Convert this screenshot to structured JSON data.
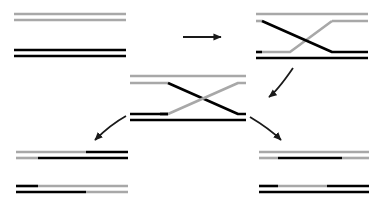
{
  "figure": {
    "title": "DNA strand exchange / Holliday junction recombination",
    "width": 377,
    "height": 211,
    "background": "#ffffff",
    "colors": {
      "black_strand": "#000000",
      "gray_strand": "#a8a8a8",
      "arrow": "#1a1a1a"
    },
    "strand_thickness": 2.6,
    "arrow_thickness": 1.8
  },
  "panels": [
    {
      "id": "panel-parental-duplexes",
      "name": "parental-duplexes",
      "label": "",
      "position": {
        "x": 14,
        "y": 12,
        "width": 112,
        "height": 46
      },
      "duplexes": [
        {
          "id": "duplex-gray-parent",
          "name": "gray-parent-duplex",
          "y": 16,
          "strands": [
            {
              "name": "top-strand",
              "segments": [
                {
                  "from": 0.0,
                  "to": 1.0,
                  "color": "#a8a8a8"
                }
              ]
            },
            {
              "name": "bottom-strand",
              "segments": [
                {
                  "from": 0.0,
                  "to": 1.0,
                  "color": "#a8a8a8"
                }
              ]
            }
          ]
        },
        {
          "id": "duplex-black-parent",
          "name": "black-parent-duplex",
          "y": 50,
          "strands": [
            {
              "name": "top-strand",
              "segments": [
                {
                  "from": 0.0,
                  "to": 1.0,
                  "color": "#000000"
                }
              ]
            },
            {
              "name": "bottom-strand",
              "segments": [
                {
                  "from": 0.0,
                  "to": 1.0,
                  "color": "#000000"
                }
              ]
            }
          ]
        }
      ]
    },
    {
      "id": "panel-crossover-upper-right",
      "name": "upper-right-crossover",
      "label": "",
      "position": {
        "x": 256,
        "y": 10,
        "width": 112,
        "height": 48
      },
      "description": "Strand invasion: gray duplex on top, black duplex below, single strands cross between them forming an X"
    },
    {
      "id": "panel-holliday-junction",
      "name": "holliday-junction-intermediate",
      "label": "",
      "position": {
        "x": 130,
        "y": 72,
        "width": 116,
        "height": 50
      },
      "description": "Holliday junction intermediate with heteroduplex regions; top strands gray-to-black, bottom strands black-to-gray"
    },
    {
      "id": "panel-products-lower-left",
      "name": "lower-left-products",
      "label": "",
      "position": {
        "x": 16,
        "y": 148,
        "width": 112,
        "height": 48
      },
      "duplexes": [
        {
          "id": "duplex-ll-upper",
          "name": "patched-duplex-upper-left",
          "y": 152,
          "strands": [
            {
              "name": "top-strand",
              "segments": [
                {
                  "from": 0.0,
                  "to": 0.63,
                  "color": "#a8a8a8"
                },
                {
                  "from": 0.63,
                  "to": 1.0,
                  "color": "#000000"
                }
              ]
            },
            {
              "name": "bottom-strand",
              "segments": [
                {
                  "from": 0.0,
                  "to": 0.2,
                  "color": "#a8a8a8"
                },
                {
                  "from": 0.2,
                  "to": 1.0,
                  "color": "#000000"
                }
              ]
            }
          ]
        },
        {
          "id": "duplex-ll-lower",
          "name": "patched-duplex-lower-left",
          "y": 186,
          "strands": [
            {
              "name": "top-strand",
              "segments": [
                {
                  "from": 0.0,
                  "to": 0.2,
                  "color": "#000000"
                },
                {
                  "from": 0.2,
                  "to": 1.0,
                  "color": "#a8a8a8"
                }
              ]
            },
            {
              "name": "bottom-strand",
              "segments": [
                {
                  "from": 0.0,
                  "to": 0.63,
                  "color": "#000000"
                },
                {
                  "from": 0.63,
                  "to": 1.0,
                  "color": "#a8a8a8"
                }
              ]
            }
          ]
        }
      ]
    },
    {
      "id": "panel-products-lower-right",
      "name": "lower-right-products",
      "label": "",
      "position": {
        "x": 259,
        "y": 148,
        "width": 110,
        "height": 48
      },
      "duplexes": [
        {
          "id": "duplex-lr-upper",
          "name": "spliced-duplex-upper-right",
          "y": 152,
          "strands": [
            {
              "name": "top-strand",
              "segments": [
                {
                  "from": 0.0,
                  "to": 1.0,
                  "color": "#a8a8a8"
                }
              ]
            },
            {
              "name": "bottom-strand",
              "segments": [
                {
                  "from": 0.0,
                  "to": 0.17,
                  "color": "#a8a8a8"
                },
                {
                  "from": 0.17,
                  "to": 0.75,
                  "color": "#000000"
                },
                {
                  "from": 0.75,
                  "to": 1.0,
                  "color": "#a8a8a8"
                }
              ]
            }
          ]
        },
        {
          "id": "duplex-lr-lower",
          "name": "spliced-duplex-lower-right",
          "y": 186,
          "strands": [
            {
              "name": "top-strand",
              "segments": [
                {
                  "from": 0.0,
                  "to": 0.17,
                  "color": "#000000"
                },
                {
                  "from": 0.17,
                  "to": 0.62,
                  "color": "#a8a8a8"
                },
                {
                  "from": 0.62,
                  "to": 1.0,
                  "color": "#000000"
                }
              ]
            },
            {
              "name": "bottom-strand",
              "segments": [
                {
                  "from": 0.0,
                  "to": 1.0,
                  "color": "#000000"
                }
              ]
            }
          ]
        }
      ]
    }
  ],
  "arrows": [
    {
      "id": "arrow-top",
      "name": "straight-arrow-right",
      "type": "straight",
      "from": {
        "x": 183,
        "y": 37
      },
      "to": {
        "x": 222,
        "y": 37
      },
      "label": ""
    },
    {
      "id": "arrow-right-down",
      "name": "curved-arrow-down-right",
      "type": "curved",
      "from": {
        "x": 291,
        "y": 70
      },
      "to": {
        "x": 268,
        "y": 99
      },
      "label": ""
    },
    {
      "id": "arrow-left-down",
      "name": "curved-arrow-down-left",
      "type": "curved",
      "from": {
        "x": 125,
        "y": 117
      },
      "to": {
        "x": 92,
        "y": 142
      },
      "label": ""
    },
    {
      "id": "arrow-to-lower-right",
      "name": "curved-arrow-to-lower-right",
      "type": "curved",
      "from": {
        "x": 248,
        "y": 118
      },
      "to": {
        "x": 283,
        "y": 142
      },
      "label": ""
    }
  ]
}
